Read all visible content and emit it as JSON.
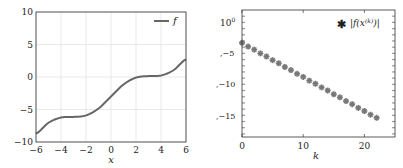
{
  "chart_data": [
    {
      "type": "line",
      "title": "",
      "xlabel": "x",
      "ylabel": "",
      "xlim": [
        -6,
        6
      ],
      "ylim": [
        -10,
        10
      ],
      "xticks": [
        -6,
        -4,
        -2,
        0,
        2,
        4,
        6
      ],
      "yticks": [
        -10,
        -5,
        0,
        5,
        10
      ],
      "xtick_labels": [
        "−6",
        "−4",
        "−2",
        "0",
        "2",
        "4",
        "6"
      ],
      "ytick_labels": [
        "−10",
        "−5",
        "0",
        "5",
        "10"
      ],
      "grid": true,
      "legend": {
        "position": "upper right",
        "entries": [
          "f"
        ]
      },
      "series": [
        {
          "name": "f",
          "color": "#666666",
          "x": [
            -6,
            -5,
            -4,
            -3,
            -2,
            -1,
            0,
            1,
            2,
            3,
            4,
            5,
            6
          ],
          "y": [
            -8.72,
            -7.04,
            -6.24,
            -6.14,
            -5.91,
            -4.84,
            -3.0,
            -1.16,
            -0.09,
            0.14,
            0.24,
            1.04,
            2.72
          ]
        }
      ]
    },
    {
      "type": "scatter",
      "title": "",
      "xlabel": "k",
      "ylabel": "",
      "yscale": "log",
      "xlim": [
        0,
        25
      ],
      "ylim_exponent": [
        -18.5,
        2
      ],
      "xticks": [
        0,
        10,
        20
      ],
      "xtick_labels": [
        "0",
        "10",
        "20"
      ],
      "yticks_exponent": [
        0,
        -5,
        -10,
        -15
      ],
      "ytick_labels": [
        "10⁰",
        ",−5",
        ",−10",
        ",−15"
      ],
      "grid": false,
      "legend": {
        "position": "upper right",
        "entries": [
          "|f(x^(k))|"
        ]
      },
      "series": [
        {
          "name": "|f(x^(k))|",
          "marker": "asterisk",
          "color": "#777777",
          "x": [
            0,
            1,
            2,
            3,
            4,
            5,
            6,
            7,
            8,
            9,
            10,
            11,
            12,
            13,
            14,
            15,
            16,
            17,
            18,
            19,
            20,
            21,
            22
          ],
          "log10_y": [
            -3.3,
            -3.9,
            -4.4,
            -5.0,
            -5.5,
            -6.1,
            -6.6,
            -7.2,
            -7.7,
            -8.3,
            -8.8,
            -9.4,
            -9.9,
            -10.5,
            -11.0,
            -11.6,
            -12.1,
            -12.7,
            -13.2,
            -13.8,
            -14.3,
            -14.9,
            -15.4
          ]
        }
      ]
    }
  ],
  "labels": {
    "left_xlabel": "x",
    "left_legend": "f",
    "right_xlabel": "k",
    "right_legend_prefix": "|f(x",
    "right_legend_sup": "(k)",
    "right_legend_suffix": ")|",
    "right_ytick_top_base": "10",
    "right_ytick_top_exp": "0"
  }
}
